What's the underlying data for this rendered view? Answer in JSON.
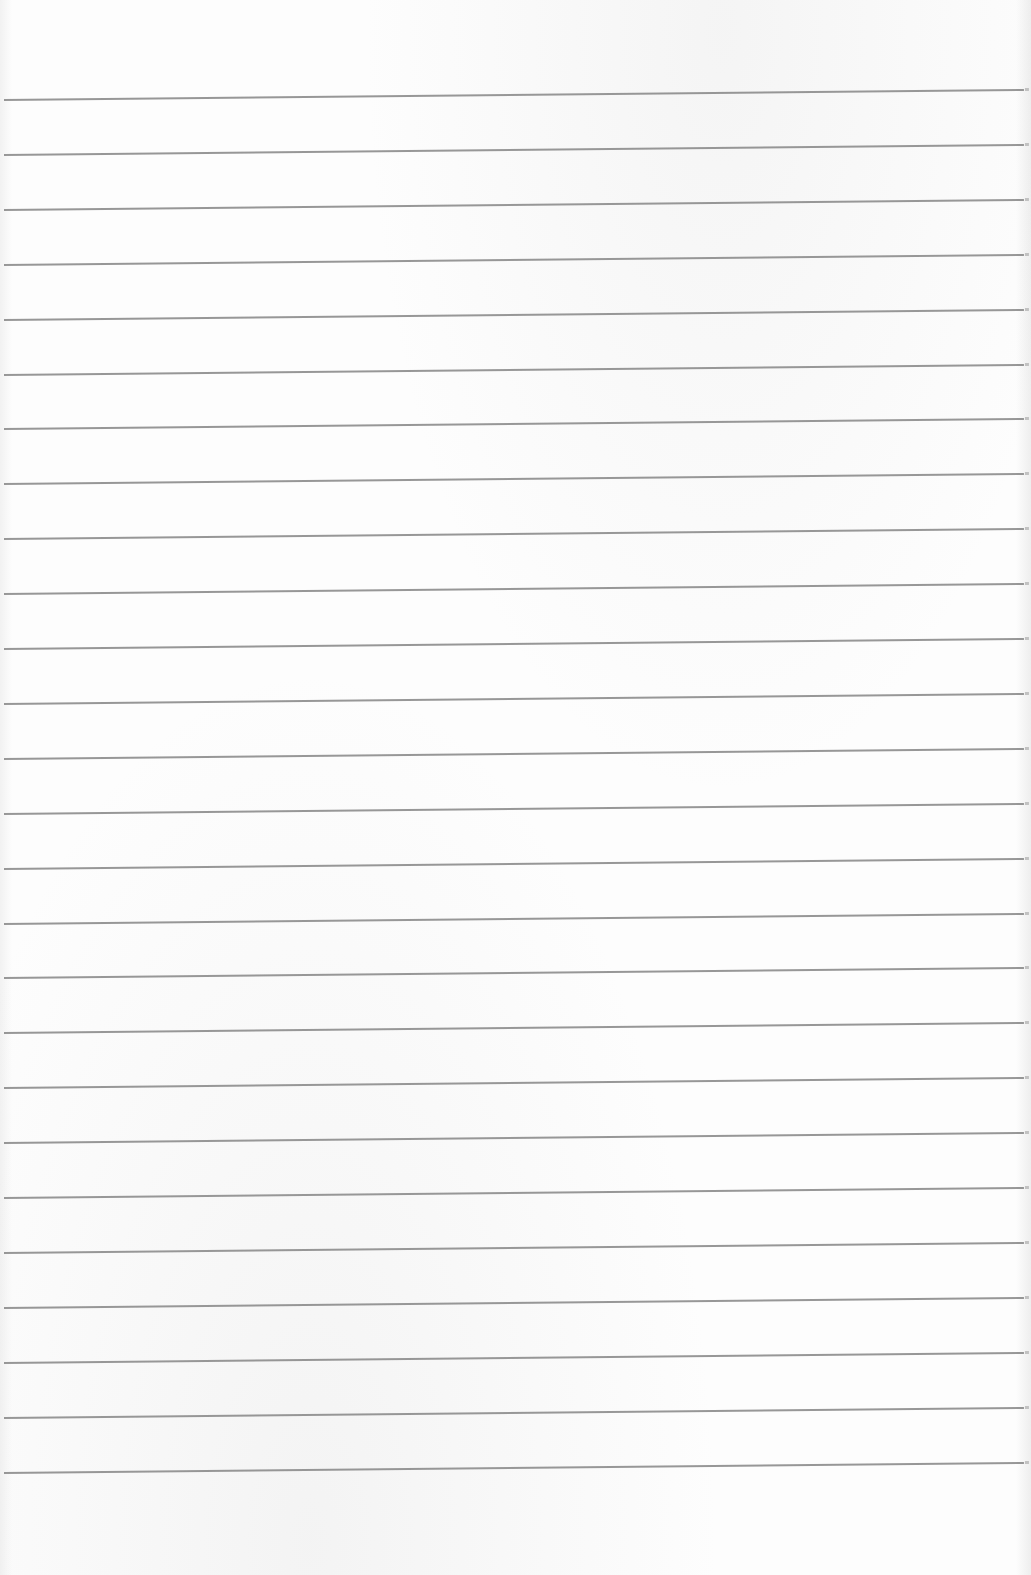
{
  "page": {
    "type": "lined-paper",
    "background_color": "#fdfdfd",
    "rule_color": "#8c8c8c",
    "rule_count": 26,
    "rule_spacing_px": 55,
    "first_rule_y_left": 100,
    "text_content": ""
  }
}
